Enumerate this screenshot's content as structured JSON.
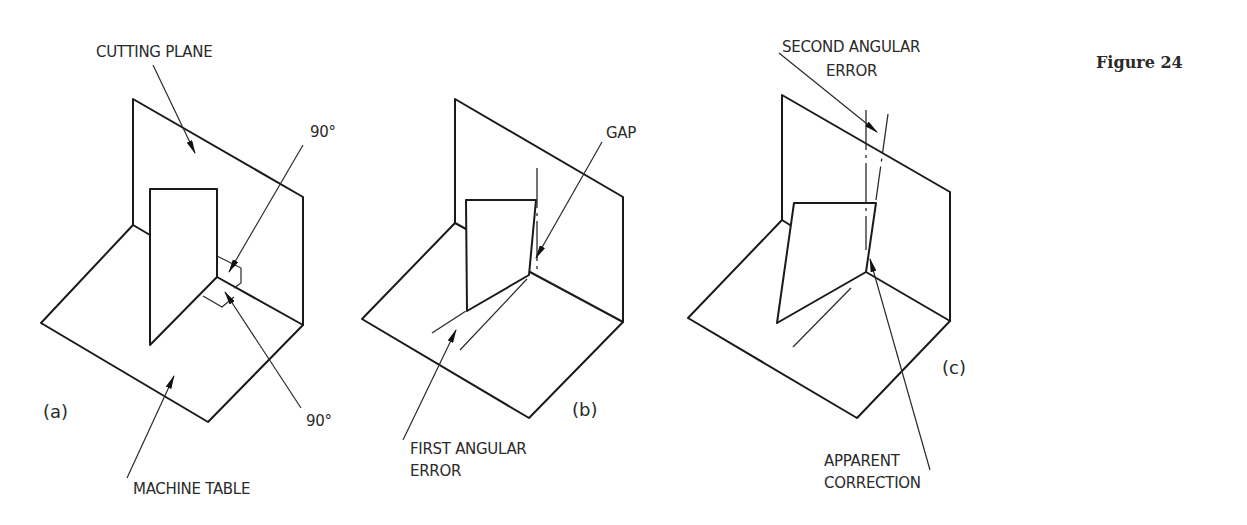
{
  "figure": {
    "title": "Figure 24"
  },
  "panels": [
    {
      "id": "a",
      "label": "(a)",
      "annotations": {
        "cutting_plane": "CUTTING PLANE",
        "angle_upper": "90°",
        "angle_lower": "90°",
        "machine_table": "MACHINE TABLE"
      }
    },
    {
      "id": "b",
      "label": "(b)",
      "annotations": {
        "gap": "GAP",
        "first_error_line1": "FIRST ANGULAR",
        "first_error_line2": "ERROR"
      }
    },
    {
      "id": "c",
      "label": "(c)",
      "annotations": {
        "second_error_line1": "SECOND ANGULAR",
        "second_error_line2": "ERROR",
        "correction_line1": "APPARENT",
        "correction_line2": "CORRECTION"
      }
    }
  ],
  "colors": {
    "line": "#1a1a1a",
    "text": "#2a2a2a",
    "background": "#ffffff"
  }
}
